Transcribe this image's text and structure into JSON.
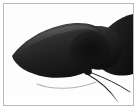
{
  "image": {
    "kind": "photo-thumbnail",
    "subject": "dark moth wings with thin legs",
    "alt_text": "Close-up photograph of a dark, glossy moth or butterfly with two overlapping near-black wings and two thin legs extending to the lower right, on a white background",
    "caption": "",
    "width": 137,
    "height": 112
  },
  "frame": {
    "border_color": "#b9b9b9",
    "margin_color": "#ffffff",
    "border_width_px": 1,
    "margin_px": 3
  },
  "palette": {
    "background": "#ffffff",
    "photo_background": "#fdfdfd",
    "wing_dark": "#1b1b1b",
    "wing_mid": "#2f2f2f",
    "wing_light": "#555555",
    "wing_sheen": "#6e6e6e",
    "wing_deep_shadow": "#0a0a0a",
    "leg_dark": "#232323",
    "leg_light": "#b4b4b4",
    "separation_white": "#ffffff"
  },
  "elements": [
    {
      "name": "front-wing",
      "label": "Front wing",
      "tone": "#242424"
    },
    {
      "name": "rear-wing",
      "label": "Rear wing",
      "tone": "#1a1a1a"
    },
    {
      "name": "wing-sheen",
      "label": "Wing highlight",
      "tone": "#6e6e6e"
    },
    {
      "name": "wing-notch",
      "label": "Wing separation gap",
      "tone": "#ffffff"
    },
    {
      "name": "leg-upper",
      "label": "Upper leg",
      "tone": "#232323"
    },
    {
      "name": "leg-lower",
      "label": "Lower leg",
      "tone": "#232323"
    },
    {
      "name": "leg-pale",
      "label": "Pale underwing edge",
      "tone": "#b4b4b4"
    }
  ]
}
